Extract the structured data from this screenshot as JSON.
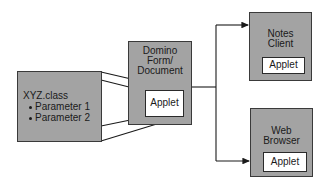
{
  "diagram": {
    "source_class": {
      "title": "XYZ.class",
      "parameters": [
        "Parameter 1",
        "Parameter 2"
      ]
    },
    "domino": {
      "label_lines": [
        "Domino",
        "Form/",
        "Document"
      ],
      "applet_label": "Applet"
    },
    "notes_client": {
      "label_lines": [
        "Notes",
        "Client"
      ],
      "applet_label": "Applet"
    },
    "web_browser": {
      "label_lines": [
        "Web",
        "Browser"
      ],
      "applet_label": "Applet"
    },
    "colors": {
      "box_fill": "#a3a3a3",
      "box_border": "#3a3a3a",
      "applet_fill": "#ffffff",
      "line": "#1a1a1a"
    }
  }
}
